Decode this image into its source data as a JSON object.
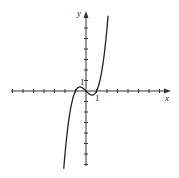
{
  "chart_data": {
    "type": "line",
    "title": "",
    "xlabel": "x",
    "ylabel": "y",
    "function": "y = x^3 - x",
    "xlim": [
      -7,
      8
    ],
    "ylim": [
      -7,
      8
    ],
    "tick_labels": {
      "x": [
        "1"
      ],
      "y": [
        "1"
      ]
    },
    "grid": false,
    "points": [
      {
        "x": -2.1,
        "y": -7.16
      },
      {
        "x": -1.5,
        "y": -1.875
      },
      {
        "x": -1.0,
        "y": 0
      },
      {
        "x": -0.577,
        "y": 0.385
      },
      {
        "x": 0,
        "y": 0
      },
      {
        "x": 0.577,
        "y": -0.385
      },
      {
        "x": 1.0,
        "y": 0
      },
      {
        "x": 1.5,
        "y": 1.875
      },
      {
        "x": 2.1,
        "y": 7.16
      }
    ],
    "color": "#222222"
  },
  "labels": {
    "x_axis": "x",
    "y_axis": "y",
    "x_tick_one": "1",
    "y_tick_one": "1"
  }
}
